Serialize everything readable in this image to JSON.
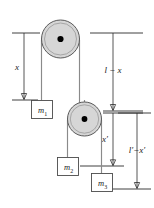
{
  "figure": {
    "background_color": "#ffffff",
    "width": 154,
    "height": 208,
    "colors": {
      "pulley_fill": "#d6d6d6",
      "pulley_stroke": "#5a5a5a",
      "hub": "#000000",
      "rope": "#8a8a8a",
      "dimension_line": "#2b2b2b",
      "mass_box_stroke": "#4a4a4a",
      "mass_box_fill": "#ffffff"
    }
  },
  "pulleys": [
    {
      "name": "upper-pulley",
      "cx": 60.5,
      "cy": 39,
      "r_outer": 19,
      "r_inner": 16,
      "r_hub": 3.1
    },
    {
      "name": "lower-pulley",
      "cx": 84.5,
      "cy": 119,
      "r_outer": 17,
      "r_inner": 14.2,
      "r_hub": 2.9
    }
  ],
  "masses": [
    {
      "name": "mass-m1",
      "label": "m",
      "subscript": "1",
      "x": 40,
      "y": 100,
      "w": 21,
      "h": 18
    },
    {
      "name": "mass-m2",
      "label": "m",
      "subscript": "2",
      "x": 57,
      "y": 157,
      "w": 21,
      "h": 18
    },
    {
      "name": "mass-m3",
      "label": "m",
      "subscript": "3",
      "x": 86,
      "y": 173,
      "w": 21,
      "h": 18
    }
  ],
  "dimensions": [
    {
      "name": "dimension-x",
      "label": "x",
      "label_x": 19,
      "label_y": 70,
      "line_x": 24,
      "y_top": 33,
      "y_bottom": 100,
      "tick_top": {
        "x1": 12,
        "x2": 40
      },
      "tick_bottom": {
        "x1": 12,
        "x2": 38
      }
    },
    {
      "name": "dimension-l-minus-x",
      "label": "l − x",
      "label_x": 104,
      "label_y": 72,
      "line_x": 113,
      "y_top": 33,
      "y_bottom": 110,
      "tick_top": {
        "x1": 90,
        "x2": 142
      },
      "tick_bottom": {
        "x1": 102,
        "x2": 142
      }
    },
    {
      "name": "dimension-x-prime",
      "label": "x′",
      "label_x": 107,
      "label_y": 143,
      "line_x": 113,
      "y_top": 112,
      "y_bottom": 166,
      "tick_top": {
        "x1": 102,
        "x2": 142
      },
      "tick_bottom": {
        "x1": 80,
        "x2": 124
      }
    },
    {
      "name": "dimension-l-prime-minus-x-prime",
      "label": "l′−x′",
      "label_x": 122,
      "label_y": 152,
      "line_x": 137,
      "y_top": 112,
      "y_bottom": 189,
      "tick_top": {
        "x1": 118,
        "x2": 150
      },
      "tick_bottom": {
        "x1": 110,
        "x2": 150
      }
    }
  ],
  "ropes": [
    {
      "name": "rope-upper-left",
      "x": 41.5,
      "y_top": 39,
      "y_bottom": 100
    },
    {
      "name": "rope-upper-right",
      "x": 79.5,
      "y_top": 39,
      "y_bottom": 104
    },
    {
      "name": "rope-lower-left",
      "x": 67.5,
      "y_top": 119,
      "y_bottom": 157
    },
    {
      "name": "rope-lower-right",
      "x": 101.5,
      "y_top": 119,
      "y_bottom": 173
    },
    {
      "name": "rope-pulley-hanger",
      "x": 84.5,
      "y_top": 104,
      "y_bottom": 119
    }
  ]
}
